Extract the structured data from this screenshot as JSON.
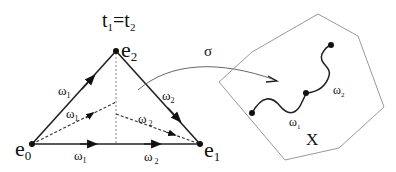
{
  "diagram": {
    "title": "t",
    "title_sub1": "1",
    "title_eq": "=t",
    "title_sub2": "2",
    "vertices": {
      "e0": {
        "base": "e",
        "sub": "0"
      },
      "e1": {
        "base": "e",
        "sub": "1"
      },
      "e2": {
        "base": "e",
        "sub": "2"
      }
    },
    "edge_labels": {
      "left_edge": {
        "base": "ω",
        "sub": "1"
      },
      "right_edge": {
        "base": "ω",
        "sub": "2"
      },
      "inner_left": {
        "base": "ω",
        "sub": "1"
      },
      "inner_right": {
        "base": "ω",
        "sub": " 2"
      },
      "bottom_left": {
        "base": "ω",
        "sub": "1"
      },
      "bottom_right": {
        "base": "ω",
        "sub": " 2"
      }
    },
    "map_label": "σ",
    "space_label": "X",
    "path_labels": {
      "first": {
        "base": "ω",
        "sub": "1"
      },
      "second": {
        "base": "ω",
        "sub": "2"
      }
    }
  }
}
